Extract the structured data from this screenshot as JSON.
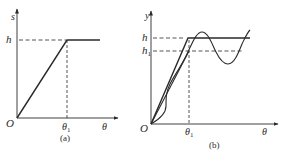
{
  "panels": [
    {
      "id": "a",
      "caption": "(a)",
      "y_axis_label": "s",
      "x_axis_label": "θ",
      "origin_label": "O",
      "level_label": "h",
      "tick_label": "θ",
      "tick_sub": "1",
      "description": "Linear rise from origin to height h at θ1, then constant dwell"
    },
    {
      "id": "b",
      "caption": "(b)",
      "y_axis_label": "y",
      "x_axis_label": "θ",
      "origin_label": "O",
      "level_label": "h",
      "level2_label": "h",
      "level2_sub": "1",
      "tick_label": "θ",
      "tick_sub": "1",
      "description": "Rise lines to h and h1 with oscillating (vibrating) follower response around h"
    }
  ],
  "colors": {
    "stroke": "#2a2a2a",
    "background": "#ffffff"
  }
}
